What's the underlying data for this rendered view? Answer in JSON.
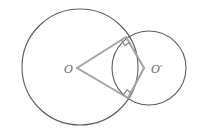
{
  "diagram": {
    "type": "geometry",
    "labels": {
      "center_big": "O",
      "center_small": "O′"
    },
    "circles": [
      {
        "name": "circle-O",
        "cx": 80,
        "cy": 67,
        "r": 58
      },
      {
        "name": "circle-O-prime",
        "cx": 149,
        "cy": 68,
        "r": 37
      }
    ],
    "points": {
      "O": [
        77,
        68
      ],
      "O_prime": [
        144,
        68
      ],
      "T1": [
        126,
        37
      ],
      "T2": [
        128,
        98
      ]
    },
    "right_angles": [
      "T1",
      "T2"
    ],
    "colors": {
      "circle_stroke": "#5a5a5a",
      "segment_stroke": "#a3a3a3",
      "label": "#666666"
    }
  }
}
